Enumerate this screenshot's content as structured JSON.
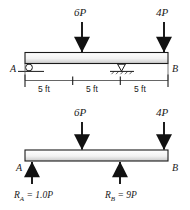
{
  "diagram": {
    "colors": {
      "ink": "#1a1a1a",
      "beam_fill_top": "#ffffff",
      "beam_fill_bottom": "#d9d9d9",
      "beam_outline": "#1a1a1a",
      "dimension_line": "#555555",
      "background": "#ffffff"
    },
    "loaded_beam": {
      "name": "loaded-beam-diagram",
      "end_labels": {
        "left": "A",
        "right": "B"
      },
      "loads": [
        {
          "label": "6P",
          "magnitude": 6,
          "unit": "P",
          "direction": "down",
          "station_ft": 5
        },
        {
          "label": "4P",
          "magnitude": 4,
          "unit": "P",
          "direction": "down",
          "station_ft": 15
        }
      ],
      "supports": [
        {
          "type": "roller",
          "label": "A",
          "station_ft": 0
        },
        {
          "type": "pin",
          "label": "",
          "station_ft": 10
        }
      ],
      "dimensions": [
        {
          "label": "5 ft",
          "value": 5,
          "unit": "ft"
        },
        {
          "label": "5 ft",
          "value": 5,
          "unit": "ft"
        },
        {
          "label": "5 ft",
          "value": 5,
          "unit": "ft"
        }
      ],
      "total_span": {
        "value": 15,
        "unit": "ft"
      }
    },
    "reaction_beam": {
      "name": "reaction-beam-diagram",
      "end_labels": {
        "left": "A",
        "right": "B"
      },
      "loads": [
        {
          "label": "6P",
          "magnitude": 6,
          "unit": "P",
          "direction": "down",
          "station_ft": 5
        },
        {
          "label": "4P",
          "magnitude": 4,
          "unit": "P",
          "direction": "down",
          "station_ft": 15
        }
      ],
      "reactions": [
        {
          "name": "R_A",
          "symbol": "R",
          "subscript": "A",
          "equals": "=",
          "value": "1.0P",
          "direction": "up",
          "station_ft": 0
        },
        {
          "name": "R_B",
          "symbol": "R",
          "subscript": "B",
          "equals": "=",
          "value": "9P",
          "direction": "up",
          "station_ft": 10
        }
      ]
    }
  }
}
